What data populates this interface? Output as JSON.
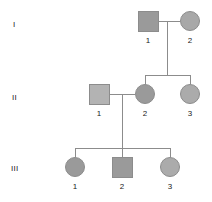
{
  "figure": {
    "type": "pedigree-chart",
    "background": "#ffffff",
    "line_color": "#8c8c8c",
    "border_color": "#8c8c8c",
    "text_color": "#1a1a1a"
  },
  "generations": [
    {
      "id": "I",
      "label": "I",
      "label_x": 13,
      "label_y": 21
    },
    {
      "id": "II",
      "label": "II",
      "label_x": 12,
      "label_y": 94
    },
    {
      "id": "III",
      "label": "III",
      "label_x": 11,
      "label_y": 165
    }
  ],
  "individuals": [
    {
      "id": "I-1",
      "generation": "I",
      "index": "1",
      "shape": "square",
      "sex": "male",
      "fill": "#9a9a9a",
      "cx": 148,
      "cy": 21,
      "size": 21,
      "label_x": 148,
      "label_y": 37
    },
    {
      "id": "I-2",
      "generation": "I",
      "index": "2",
      "shape": "circle",
      "sex": "female",
      "fill": "#a8a8a8",
      "cx": 190,
      "cy": 21,
      "size": 20,
      "label_x": 190,
      "label_y": 37
    },
    {
      "id": "II-1",
      "generation": "II",
      "index": "1",
      "shape": "square",
      "sex": "male",
      "fill": "#b3b3b3",
      "cx": 99,
      "cy": 94,
      "size": 21,
      "label_x": 99,
      "label_y": 110
    },
    {
      "id": "II-2",
      "generation": "II",
      "index": "2",
      "shape": "circle",
      "sex": "female",
      "fill": "#9a9a9a",
      "cx": 145,
      "cy": 94,
      "size": 20,
      "label_x": 145,
      "label_y": 110
    },
    {
      "id": "II-3",
      "generation": "II",
      "index": "3",
      "shape": "circle",
      "sex": "female",
      "fill": "#ababab",
      "cx": 190,
      "cy": 94,
      "size": 20,
      "label_x": 190,
      "label_y": 110
    },
    {
      "id": "III-1",
      "generation": "III",
      "index": "1",
      "shape": "circle",
      "sex": "female",
      "fill": "#9a9a9a",
      "cx": 75,
      "cy": 167,
      "size": 20,
      "label_x": 75,
      "label_y": 183
    },
    {
      "id": "III-2",
      "generation": "III",
      "index": "2",
      "shape": "square",
      "sex": "male",
      "fill": "#9a9a9a",
      "cx": 122,
      "cy": 167,
      "size": 21,
      "label_x": 122,
      "label_y": 183
    },
    {
      "id": "III-3",
      "generation": "III",
      "index": "3",
      "shape": "circle",
      "sex": "female",
      "fill": "#ababab",
      "cx": 170,
      "cy": 167,
      "size": 20,
      "label_x": 170,
      "label_y": 183
    }
  ],
  "connectors": [
    {
      "id": "mating-I",
      "kind": "mating-line",
      "orient": "h",
      "x": 158,
      "y": 21,
      "length": 22
    },
    {
      "id": "descent-I",
      "kind": "descent-line",
      "orient": "v",
      "x": 167,
      "y": 21,
      "length": 54
    },
    {
      "id": "sibship-II",
      "kind": "sibship-bar",
      "orient": "h",
      "x": 145,
      "y": 75,
      "length": 46
    },
    {
      "id": "drop-II-2",
      "kind": "sib-drop",
      "orient": "v",
      "x": 145,
      "y": 75,
      "length": 9
    },
    {
      "id": "drop-II-3",
      "kind": "sib-drop",
      "orient": "v",
      "x": 190,
      "y": 75,
      "length": 9
    },
    {
      "id": "mating-II",
      "kind": "mating-line",
      "orient": "h",
      "x": 109,
      "y": 94,
      "length": 26
    },
    {
      "id": "descent-II",
      "kind": "descent-line",
      "orient": "v",
      "x": 122,
      "y": 94,
      "length": 54
    },
    {
      "id": "sibship-III",
      "kind": "sibship-bar",
      "orient": "h",
      "x": 75,
      "y": 148,
      "length": 96
    },
    {
      "id": "drop-III-1",
      "kind": "sib-drop",
      "orient": "v",
      "x": 75,
      "y": 148,
      "length": 9
    },
    {
      "id": "drop-III-2",
      "kind": "sib-drop",
      "orient": "v",
      "x": 122,
      "y": 148,
      "length": 9
    },
    {
      "id": "drop-III-3",
      "kind": "sib-drop",
      "orient": "v",
      "x": 170,
      "y": 148,
      "length": 9
    }
  ]
}
